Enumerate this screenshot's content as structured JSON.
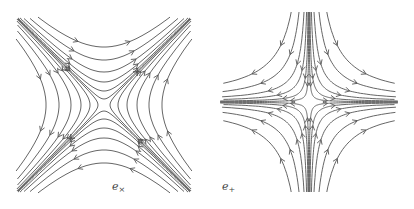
{
  "figures": [
    {
      "id": "e_cross",
      "label": "e",
      "label_sub": "×",
      "label_pos": [
        112,
        186
      ],
      "type": "hyperbola-x2-y2",
      "center": [
        104,
        105
      ],
      "half_size": 88,
      "params": [
        6,
        14,
        23,
        33,
        45,
        58
      ],
      "flow": "top-right, bottom-left, left-down, right-up"
    },
    {
      "id": "e_plus",
      "label": "e",
      "label_sub": "+",
      "label_pos": [
        222,
        186
      ],
      "type": "hyperbola-xy",
      "center": [
        309,
        102
      ],
      "half_size": 90,
      "params": [
        25,
        90,
        220,
        450,
        900,
        1600
      ],
      "flow": "vertical-inward, horizontal-outward"
    }
  ],
  "colors": {
    "stroke": "#555555",
    "background": "#ffffff"
  }
}
